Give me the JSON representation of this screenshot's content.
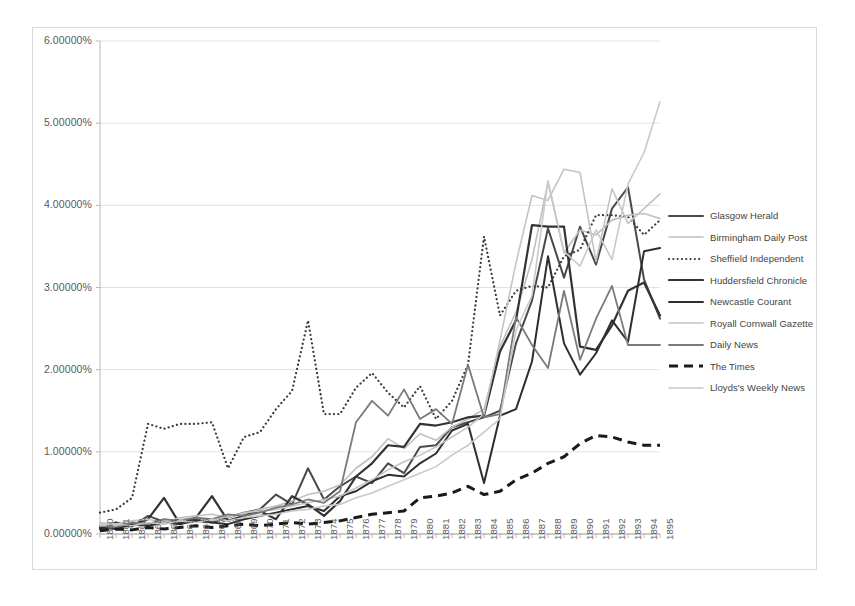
{
  "chart_data": {
    "type": "line",
    "title": "",
    "xlabel": "",
    "ylabel": "",
    "ylim": [
      0,
      6
    ],
    "yticks": [
      0,
      1,
      2,
      3,
      4,
      5,
      6
    ],
    "ytick_labels": [
      "0.00000%",
      "1.00000%",
      "2.00000%",
      "3.00000%",
      "4.00000%",
      "5.00000%",
      "6.00000%"
    ],
    "grid": true,
    "legend_position": "right",
    "categories": [
      "1860",
      "1861",
      "1862",
      "1863",
      "1864",
      "1865",
      "1866",
      "1867",
      "1868",
      "1869",
      "1870",
      "1871",
      "1872",
      "1873",
      "1874",
      "1875",
      "1876",
      "1877",
      "1878",
      "1879",
      "1880",
      "1881",
      "1882",
      "1883",
      "1884",
      "1885",
      "1886",
      "1887",
      "1888",
      "1889",
      "1890",
      "1891",
      "1892",
      "1893",
      "1894",
      "1895"
    ],
    "series": [
      {
        "name": "Glasgow Herald",
        "color": "#4a4a4a",
        "style": "solid",
        "width": 2.0,
        "values": [
          0.1,
          0.12,
          0.09,
          0.22,
          0.15,
          0.13,
          0.18,
          0.14,
          0.2,
          0.26,
          0.3,
          0.48,
          0.36,
          0.8,
          0.42,
          0.58,
          0.7,
          0.62,
          0.86,
          0.74,
          1.06,
          1.08,
          1.3,
          1.36,
          1.42,
          1.5,
          2.32,
          2.84,
          3.72,
          3.12,
          3.74,
          3.28,
          3.96,
          4.22,
          3.1,
          2.62
        ]
      },
      {
        "name": "Birmingham Daily Post",
        "color": "#bfbfbf",
        "style": "solid",
        "width": 1.6,
        "values": [
          0.12,
          0.1,
          0.14,
          0.12,
          0.16,
          0.18,
          0.2,
          0.16,
          0.22,
          0.24,
          0.3,
          0.34,
          0.4,
          0.48,
          0.52,
          0.6,
          0.8,
          0.94,
          1.16,
          1.04,
          1.22,
          1.14,
          1.3,
          1.4,
          1.52,
          2.28,
          2.7,
          3.34,
          4.28,
          3.42,
          3.7,
          3.64,
          3.82,
          3.88,
          3.9,
          3.84
        ]
      },
      {
        "name": "Sheffield Independent",
        "color": "#3a3a3a",
        "style": "dotted",
        "width": 2.2,
        "values": [
          0.26,
          0.3,
          0.44,
          1.34,
          1.28,
          1.34,
          1.34,
          1.36,
          0.8,
          1.18,
          1.24,
          1.52,
          1.74,
          2.6,
          1.46,
          1.46,
          1.78,
          1.96,
          1.72,
          1.54,
          1.8,
          1.4,
          1.62,
          2.06,
          3.62,
          2.66,
          2.96,
          3.02,
          3.0,
          3.38,
          3.46,
          3.88,
          3.88,
          3.86,
          3.64,
          3.82
        ]
      },
      {
        "name": "Huddersfield Chronicle",
        "color": "#333333",
        "style": "solid",
        "width": 2.2,
        "values": [
          0.06,
          0.14,
          0.1,
          0.18,
          0.44,
          0.12,
          0.2,
          0.46,
          0.16,
          0.22,
          0.28,
          0.18,
          0.46,
          0.36,
          0.22,
          0.4,
          0.7,
          0.86,
          1.08,
          1.06,
          1.34,
          1.32,
          1.36,
          1.42,
          1.44,
          2.22,
          2.6,
          3.76,
          3.74,
          3.74,
          2.28,
          2.24,
          2.54,
          2.96,
          3.06,
          2.66
        ]
      },
      {
        "name": "Newcastle Courant",
        "color": "#2e2e2e",
        "style": "solid",
        "width": 2.0,
        "values": [
          0.08,
          0.06,
          0.12,
          0.1,
          0.14,
          0.12,
          0.16,
          0.14,
          0.12,
          0.18,
          0.22,
          0.26,
          0.3,
          0.34,
          0.28,
          0.46,
          0.52,
          0.64,
          0.72,
          0.7,
          0.86,
          0.98,
          1.26,
          1.34,
          0.62,
          1.44,
          1.52,
          2.1,
          3.38,
          2.32,
          1.94,
          2.2,
          2.6,
          2.34,
          3.44,
          3.48
        ]
      },
      {
        "name": "Royall Cornwall Gazette",
        "color": "#c4c4c4",
        "style": "solid",
        "width": 1.6,
        "values": [
          0.14,
          0.12,
          0.16,
          0.18,
          0.14,
          0.2,
          0.22,
          0.24,
          0.2,
          0.26,
          0.28,
          0.3,
          0.34,
          0.38,
          0.42,
          0.46,
          0.56,
          0.66,
          0.78,
          0.88,
          0.96,
          1.06,
          1.18,
          1.3,
          1.46,
          2.36,
          3.3,
          4.12,
          4.06,
          4.44,
          4.4,
          3.32,
          4.2,
          3.78,
          3.96,
          4.14
        ]
      },
      {
        "name": "Daily News",
        "color": "#7a7a7a",
        "style": "solid",
        "width": 1.8,
        "values": [
          0.1,
          0.08,
          0.14,
          0.12,
          0.18,
          0.16,
          0.2,
          0.18,
          0.24,
          0.22,
          0.26,
          0.32,
          0.36,
          0.42,
          0.38,
          0.52,
          1.36,
          1.62,
          1.44,
          1.76,
          1.4,
          1.52,
          1.34,
          2.06,
          1.42,
          1.46,
          2.64,
          2.3,
          2.02,
          2.96,
          2.12,
          2.62,
          3.02,
          2.3,
          2.3,
          2.3
        ]
      },
      {
        "name": "The Times",
        "color": "#1a1a1a",
        "style": "dashed",
        "width": 3.0,
        "values": [
          0.04,
          0.06,
          0.05,
          0.08,
          0.06,
          0.08,
          0.1,
          0.08,
          0.1,
          0.12,
          0.1,
          0.12,
          0.14,
          0.12,
          0.14,
          0.16,
          0.2,
          0.24,
          0.26,
          0.28,
          0.44,
          0.46,
          0.5,
          0.58,
          0.48,
          0.52,
          0.66,
          0.74,
          0.86,
          0.94,
          1.1,
          1.2,
          1.18,
          1.12,
          1.08,
          1.08
        ]
      },
      {
        "name": "Lloyds's Weekly News",
        "color": "#c9c9c9",
        "style": "solid",
        "width": 1.6,
        "values": [
          0.1,
          0.12,
          0.1,
          0.14,
          0.12,
          0.16,
          0.14,
          0.18,
          0.16,
          0.2,
          0.22,
          0.24,
          0.28,
          0.3,
          0.34,
          0.36,
          0.44,
          0.5,
          0.58,
          0.66,
          0.74,
          0.82,
          0.96,
          1.08,
          1.24,
          1.4,
          2.48,
          2.9,
          4.3,
          3.44,
          3.26,
          3.7,
          3.34,
          4.26,
          4.64,
          5.26
        ]
      }
    ]
  },
  "axis": {
    "y_tick_labels": [
      "6.00000%",
      "5.00000%",
      "4.00000%",
      "3.00000%",
      "2.00000%",
      "1.00000%",
      "0.00000%"
    ],
    "x_tick_labels": [
      "1860",
      "1861",
      "1862",
      "1863",
      "1864",
      "1865",
      "1866",
      "1867",
      "1868",
      "1869",
      "1870",
      "1871",
      "1872",
      "1873",
      "1874",
      "1875",
      "1876",
      "1877",
      "1878",
      "1879",
      "1880",
      "1881",
      "1882",
      "1883",
      "1884",
      "1885",
      "1886",
      "1887",
      "1888",
      "1889",
      "1890",
      "1891",
      "1892",
      "1893",
      "1894",
      "1895"
    ]
  },
  "legend": {
    "items": [
      {
        "label": "Glasgow Herald"
      },
      {
        "label": "Birmingham Daily Post"
      },
      {
        "label": "Sheffield Independent"
      },
      {
        "label": "Huddersfield Chronicle"
      },
      {
        "label": "Newcastle Courant"
      },
      {
        "label": "Royall Cornwall Gazette"
      },
      {
        "label": "Daily News"
      },
      {
        "label": "The Times"
      },
      {
        "label": "Lloyds's Weekly News"
      }
    ]
  },
  "colors": {
    "grid": "#e2e2e2",
    "axis": "#b8b8b8",
    "frame": "#d9d9d9",
    "text": "#595959",
    "background": "#ffffff"
  }
}
